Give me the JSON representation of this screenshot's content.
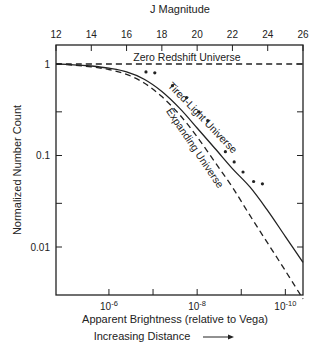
{
  "chart_data": {
    "type": "line",
    "title": "",
    "top_axis": {
      "label": "J Magnitude",
      "range": [
        12,
        26
      ],
      "ticks": [
        12,
        14,
        16,
        18,
        20,
        22,
        24,
        26
      ],
      "tick_labels": [
        "12",
        "14",
        "16",
        "18",
        "20",
        "22",
        "24",
        "26"
      ]
    },
    "bottom_axis": {
      "label": "Apparent Brightness (relative to Vega)",
      "sublabel": "Increasing Distance",
      "scale": "log",
      "tick_values_log10": [
        -6,
        -7,
        -8,
        -9,
        -10
      ],
      "labeled_ticks": [
        {
          "log10": -6,
          "base": "10",
          "exp": "-6"
        },
        {
          "log10": -8,
          "base": "10",
          "exp": "-8"
        },
        {
          "log10": -10,
          "base": "10",
          "exp": "-10"
        }
      ],
      "mag_at_log10_minus6": 15
    },
    "y_axis": {
      "label": "Normalized Number Count",
      "scale": "log",
      "range": [
        0.0022,
        1.4
      ],
      "ticks": [
        1,
        0.1,
        0.01
      ],
      "tick_labels": [
        "1",
        "0.1",
        "0.01"
      ],
      "minor_ticks": [
        0.3,
        0.03
      ]
    },
    "series": [
      {
        "name": "Zero Redshift Universe",
        "style": "dashed",
        "x": [
          12,
          26
        ],
        "y": [
          1.0,
          1.0
        ]
      },
      {
        "name": "Tired-Light Universe",
        "style": "solid",
        "x": [
          12,
          13,
          14,
          15,
          16,
          17,
          18,
          19,
          20,
          21,
          22,
          23,
          24,
          25,
          26
        ],
        "y": [
          1.0,
          0.98,
          0.95,
          0.9,
          0.82,
          0.68,
          0.5,
          0.33,
          0.2,
          0.12,
          0.072,
          0.045,
          0.025,
          0.013,
          0.0068
        ]
      },
      {
        "name": "Expanding Universe",
        "style": "dashed",
        "x": [
          12,
          13,
          14,
          15,
          16,
          17,
          18,
          19,
          20,
          21,
          22,
          23,
          24,
          25,
          26
        ],
        "y": [
          1.0,
          0.97,
          0.93,
          0.87,
          0.77,
          0.62,
          0.44,
          0.28,
          0.16,
          0.085,
          0.045,
          0.022,
          0.011,
          0.0055,
          0.0027
        ]
      },
      {
        "name": "Observed counts",
        "style": "points",
        "x": [
          17.1,
          17.6,
          18.6,
          19.4,
          20.1,
          20.6,
          21.6,
          22.1,
          22.6,
          23.2,
          23.7
        ],
        "y": [
          0.82,
          0.8,
          0.58,
          0.43,
          0.3,
          0.24,
          0.11,
          0.085,
          0.066,
          0.052,
          0.049
        ]
      }
    ],
    "annotations": [
      "Zero Redshift Universe",
      "Tired-Light Universe",
      "Expanding Universe"
    ],
    "grid": false,
    "legend": "none"
  }
}
